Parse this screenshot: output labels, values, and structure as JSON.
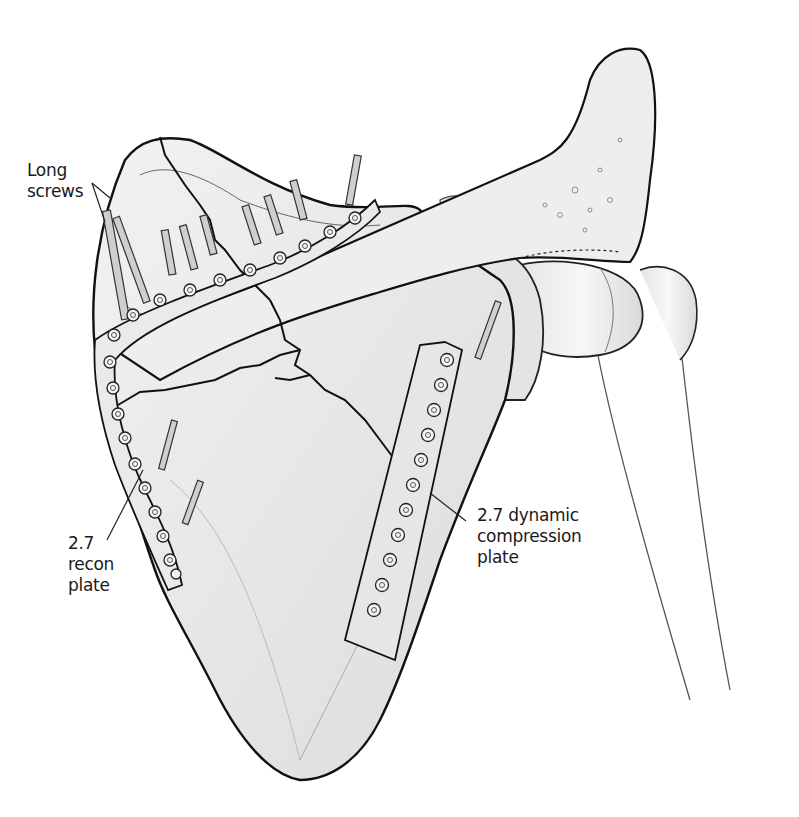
{
  "figure": {
    "colors": {
      "outline": "#111111",
      "shading": "#9a9a9a",
      "background": "#ffffff",
      "plate": "#e8e8e8"
    }
  },
  "labels": {
    "long_screws": {
      "line1": "Long",
      "line2": "screws"
    },
    "recon_plate": {
      "line1": "2.7",
      "line2": "recon",
      "line3": "plate"
    },
    "dcp_plate": {
      "line1": "2.7 dynamic",
      "line2": "compression",
      "line3": "plate"
    }
  }
}
